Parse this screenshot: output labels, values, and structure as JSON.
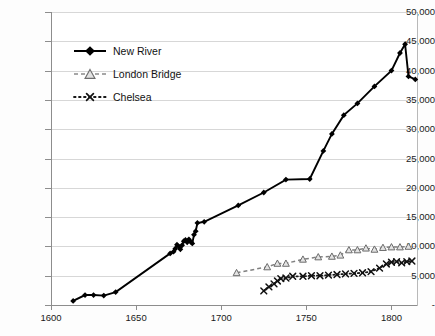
{
  "chart_data": {
    "type": "line",
    "title": "",
    "xlabel": "",
    "ylabel": "",
    "xlim": [
      1600,
      1815
    ],
    "ylim": [
      0,
      50000
    ],
    "grid": true,
    "legend_position": "upper-left-inside",
    "y_ticks": [
      "-",
      "5,000",
      "10,000",
      "15,000",
      "20,000",
      "25,000",
      "30,000",
      "35,000",
      "40,000",
      "45,000",
      "50,000"
    ],
    "y_tick_values": [
      0,
      5000,
      10000,
      15000,
      20000,
      25000,
      30000,
      35000,
      40000,
      45000,
      50000
    ],
    "x_ticks": [
      "1600",
      "1650",
      "1700",
      "1750",
      "1800"
    ],
    "x_tick_values": [
      1600,
      1650,
      1700,
      1750,
      1800
    ],
    "series": [
      {
        "name": "New River",
        "marker": "filled-diamond",
        "line": "solid",
        "color": "#000000",
        "x": [
          1613,
          1620,
          1625,
          1631,
          1638,
          1670,
          1672,
          1673,
          1674,
          1675,
          1676,
          1677,
          1678,
          1679,
          1680,
          1681,
          1682,
          1683,
          1684,
          1685,
          1686,
          1690,
          1710,
          1725,
          1738,
          1752,
          1760,
          1765,
          1772,
          1780,
          1790,
          1800,
          1805,
          1808,
          1810,
          1814
        ],
        "y": [
          700,
          1700,
          1700,
          1600,
          2200,
          8800,
          9100,
          9600,
          10300,
          10000,
          9500,
          10200,
          10900,
          11100,
          10700,
          11200,
          10800,
          10500,
          12000,
          12600,
          14000,
          14200,
          17000,
          19200,
          21400,
          21500,
          26300,
          29200,
          32400,
          34400,
          37300,
          40000,
          43000,
          44500,
          39000,
          38500
        ]
      },
      {
        "name": "London Bridge",
        "marker": "open-triangle",
        "line": "dashed",
        "color": "#808080",
        "x": [
          1709,
          1727,
          1733,
          1738,
          1748,
          1757,
          1765,
          1770,
          1775,
          1780,
          1785,
          1790,
          1795,
          1800,
          1805,
          1810
        ],
        "y": [
          5500,
          6500,
          7100,
          7100,
          7800,
          8200,
          8300,
          8500,
          9400,
          9400,
          9700,
          9500,
          9800,
          9900,
          9900,
          10000
        ]
      },
      {
        "name": "Chelsea",
        "marker": "x",
        "line": "dotted",
        "color": "#1a1a1a",
        "x": [
          1725,
          1728,
          1731,
          1733,
          1735,
          1738,
          1742,
          1748,
          1753,
          1758,
          1763,
          1768,
          1773,
          1778,
          1783,
          1788,
          1793,
          1797,
          1800,
          1803,
          1806,
          1809,
          1812
        ],
        "y": [
          2400,
          3100,
          3600,
          4100,
          4500,
          4600,
          4900,
          4900,
          5000,
          5000,
          5100,
          5200,
          5300,
          5400,
          5500,
          5700,
          6300,
          7000,
          7300,
          7400,
          7200,
          7400,
          7500
        ]
      }
    ]
  },
  "legend": {
    "items": [
      {
        "label": "New River"
      },
      {
        "label": "London Bridge"
      },
      {
        "label": "Chelsea"
      }
    ]
  }
}
